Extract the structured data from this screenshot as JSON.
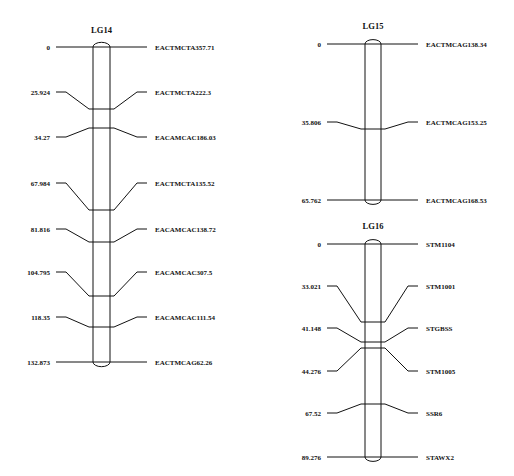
{
  "chart_data": {
    "type": "linkage-map",
    "linkage_groups": [
      {
        "name": "LG14",
        "markers": [
          {
            "position": "0",
            "name": "EACTMCTA357.71"
          },
          {
            "position": "25.924",
            "name": "EACTMCTA222.3"
          },
          {
            "position": "34.27",
            "name": "EACAMCAC186.03"
          },
          {
            "position": "67.984",
            "name": "EACTMCTA135.52"
          },
          {
            "position": "81.816",
            "name": "EACAMCAC138.72"
          },
          {
            "position": "104.795",
            "name": "EACAMCAC307.5"
          },
          {
            "position": "118.35",
            "name": "EACAMCAC111.54"
          },
          {
            "position": "132.873",
            "name": "EACTMCAG62.26"
          }
        ]
      },
      {
        "name": "LG15",
        "markers": [
          {
            "position": "0",
            "name": "EACTMCAG138.34"
          },
          {
            "position": "35.806",
            "name": "EACTMCAG153.25"
          },
          {
            "position": "65.762",
            "name": "EACTMCAG168.53"
          }
        ]
      },
      {
        "name": "LG16",
        "markers": [
          {
            "position": "0",
            "name": "STM1104"
          },
          {
            "position": "33.021",
            "name": "STM1001"
          },
          {
            "position": "41.148",
            "name": "STGBSS"
          },
          {
            "position": "44.276",
            "name": "STM1005"
          },
          {
            "position": "67.52",
            "name": "SSR6"
          },
          {
            "position": "89.276",
            "name": "STAWX2"
          }
        ]
      }
    ]
  },
  "layout": {
    "groups": [
      {
        "cx": 101.5,
        "half": 8.5,
        "title_y": 33,
        "left_x": 56,
        "right_x": 147,
        "label_y": [
          47,
          92,
          137,
          183,
          229,
          272,
          317,
          362
        ],
        "chr_y": [
          47,
          109,
          128,
          210,
          242,
          296,
          327,
          362
        ]
      },
      {
        "cx": 373,
        "half": 8,
        "title_y": 29,
        "left_x": 327,
        "right_x": 418,
        "label_y": [
          44,
          122,
          200
        ],
        "chr_y": [
          44,
          129,
          200
        ]
      },
      {
        "cx": 373,
        "half": 8,
        "title_y": 229,
        "left_x": 327,
        "right_x": 418,
        "label_y": [
          244,
          286,
          328,
          371,
          413,
          457
        ],
        "chr_y": [
          244,
          322,
          342,
          348,
          404,
          457
        ]
      }
    ]
  }
}
